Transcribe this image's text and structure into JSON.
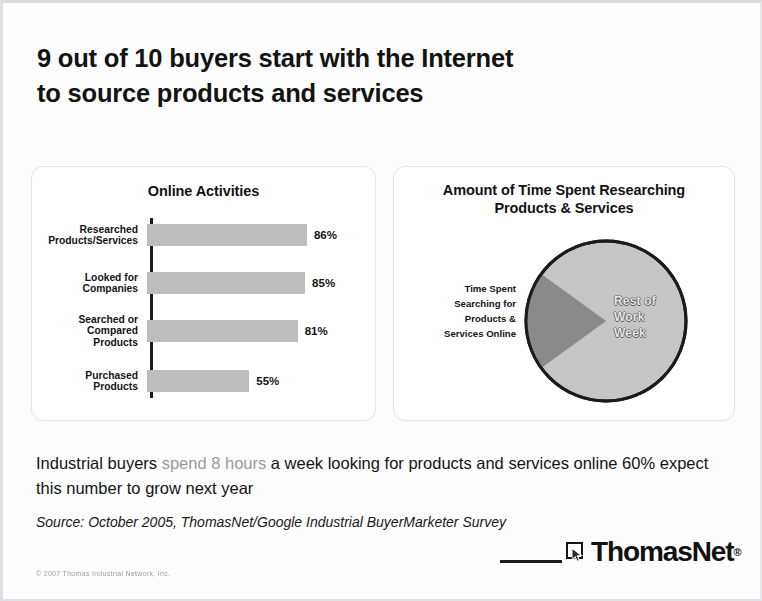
{
  "slide": {
    "title_line1": "9 out of 10 buyers start with the Internet",
    "title_line2": "to source products and services"
  },
  "chart_data": [
    {
      "type": "bar",
      "title": "Online Activities",
      "orientation": "horizontal",
      "categories": [
        "Researched Products/Services",
        "Looked for Companies",
        "Searched or Compared Products",
        "Purchased Products"
      ],
      "values": [
        86,
        85,
        81,
        55
      ],
      "value_labels": [
        "86%",
        "85%",
        "81%",
        "55%"
      ],
      "xlabel": "",
      "ylabel": "",
      "xlim": [
        0,
        100
      ],
      "grid": false,
      "legend": "none",
      "bar_color": "#bdbdbd"
    },
    {
      "type": "pie",
      "title_line1": "Amount of Time Spent Researching",
      "title_line2": "Products & Services",
      "slices": [
        {
          "label": "Time Spent Searching for Products & Services Online",
          "value": 20,
          "color": "#8a8a8a",
          "label_position": "outside-left"
        },
        {
          "label": "Rest of Work Week",
          "value": 80,
          "color": "#c6c6c6",
          "label_position": "inside-right"
        }
      ],
      "legend": "none"
    }
  ],
  "bar_chart_labels": {
    "row1_line1": "Researched",
    "row1_line2": "Products/Services",
    "row2_line1": "Looked for",
    "row2_line2": "Companies",
    "row3_line1": "Searched or",
    "row3_line2": "Compared",
    "row3_line3": "Products",
    "row4_line1": "Purchased",
    "row4_line2": "Products"
  },
  "pie_chart_labels": {
    "outside_line1": "Time Spent",
    "outside_line2": "Searching for",
    "outside_line3": "Products &",
    "outside_line4": "Services Online",
    "inside_line1": "Rest of",
    "inside_line2": "Work",
    "inside_line3": "Week"
  },
  "body": {
    "text_before": "Industrial buyers ",
    "highlight": "spend 8 hours",
    "text_after": " a week looking for products and services online 60% expect this number to grow next year",
    "highlight_color": "#9a9a9a"
  },
  "source": {
    "text": "Source: October 2005, ThomasNet/Google Industrial BuyerMarketer Survey"
  },
  "footer": {
    "logo_text": "ThomasNet",
    "logo_trademark": "®",
    "copyright": "© 2007 Thomas Industrial Network, Inc."
  }
}
